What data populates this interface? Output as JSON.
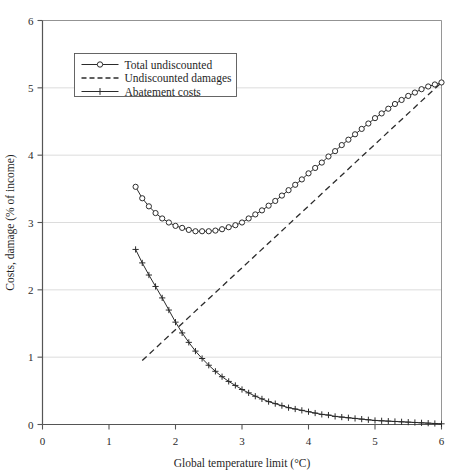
{
  "chart_data": {
    "type": "line",
    "title": "",
    "xlabel": "Global temperature limit (°C)",
    "ylabel": "Costs, damage (% of income)",
    "xlim": [
      0,
      6
    ],
    "ylim": [
      0,
      6
    ],
    "xticks": [
      0,
      1,
      2,
      3,
      4,
      5,
      6
    ],
    "yticks": [
      0,
      1,
      2,
      3,
      4,
      5,
      6
    ],
    "xtick_labels": [
      "0",
      "1",
      "2",
      "3",
      "4",
      "5",
      "6"
    ],
    "ytick_labels": [
      "0",
      "1",
      "2",
      "3",
      "4",
      "5",
      "6"
    ],
    "grid": "horizontal",
    "legend_position": "upper-left-inside",
    "series": [
      {
        "name": "Total undiscounted",
        "marker": "circle",
        "linestyle": "solid",
        "color": "#2b2b2b",
        "x": [
          1.4,
          1.5,
          1.6,
          1.7,
          1.8,
          1.9,
          2.0,
          2.1,
          2.2,
          2.3,
          2.4,
          2.5,
          2.6,
          2.7,
          2.8,
          2.9,
          3.0,
          3.1,
          3.2,
          3.3,
          3.4,
          3.5,
          3.6,
          3.7,
          3.8,
          3.9,
          4.0,
          4.1,
          4.2,
          4.3,
          4.4,
          4.5,
          4.6,
          4.7,
          4.8,
          4.9,
          5.0,
          5.1,
          5.2,
          5.3,
          5.4,
          5.5,
          5.6,
          5.7,
          5.8,
          5.9,
          6.0
        ],
        "y": [
          3.53,
          3.36,
          3.24,
          3.14,
          3.06,
          3.0,
          2.95,
          2.92,
          2.89,
          2.87,
          2.87,
          2.87,
          2.88,
          2.9,
          2.93,
          2.96,
          3.0,
          3.06,
          3.12,
          3.18,
          3.25,
          3.32,
          3.4,
          3.48,
          3.56,
          3.64,
          3.73,
          3.81,
          3.89,
          3.98,
          4.06,
          4.15,
          4.23,
          4.31,
          4.39,
          4.47,
          4.55,
          4.62,
          4.69,
          4.76,
          4.82,
          4.88,
          4.93,
          4.98,
          5.02,
          5.05,
          5.08
        ]
      },
      {
        "name": "Undiscounted damages",
        "marker": "none",
        "linestyle": "dashed",
        "color": "#2b2b2b",
        "x": [
          1.5,
          6.0
        ],
        "y": [
          0.95,
          5.08
        ]
      },
      {
        "name": "Abatement costs",
        "marker": "plus",
        "linestyle": "solid",
        "color": "#2b2b2b",
        "x": [
          1.4,
          1.5,
          1.6,
          1.7,
          1.8,
          1.9,
          2.0,
          2.1,
          2.2,
          2.3,
          2.4,
          2.5,
          2.6,
          2.7,
          2.8,
          2.9,
          3.0,
          3.1,
          3.2,
          3.3,
          3.4,
          3.5,
          3.6,
          3.7,
          3.8,
          3.9,
          4.0,
          4.1,
          4.2,
          4.3,
          4.4,
          4.5,
          4.6,
          4.7,
          4.8,
          4.9,
          5.0,
          5.1,
          5.2,
          5.3,
          5.4,
          5.5,
          5.6,
          5.7,
          5.8,
          5.9,
          6.0
        ],
        "y": [
          2.6,
          2.4,
          2.22,
          2.05,
          1.88,
          1.7,
          1.52,
          1.36,
          1.22,
          1.09,
          0.98,
          0.88,
          0.79,
          0.71,
          0.64,
          0.58,
          0.52,
          0.47,
          0.42,
          0.38,
          0.34,
          0.31,
          0.28,
          0.25,
          0.23,
          0.21,
          0.19,
          0.17,
          0.15,
          0.14,
          0.12,
          0.11,
          0.1,
          0.09,
          0.08,
          0.07,
          0.06,
          0.055,
          0.05,
          0.045,
          0.04,
          0.035,
          0.03,
          0.025,
          0.02,
          0.015,
          0.01
        ]
      }
    ],
    "legend_entries": [
      "Total undiscounted",
      "Undiscounted damages",
      "Abatement costs"
    ]
  }
}
